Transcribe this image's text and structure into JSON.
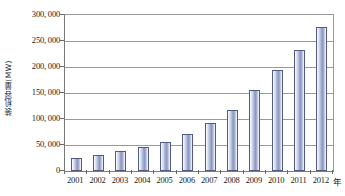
{
  "chart_data": {
    "type": "bar",
    "title": "",
    "xlabel": "年",
    "ylabel": "装机容量(MW)",
    "categories": [
      "2001",
      "2002",
      "2003",
      "2004",
      "2005",
      "2006",
      "2007",
      "2008",
      "2009",
      "2010",
      "2011",
      "2012"
    ],
    "values": [
      25000,
      31000,
      39000,
      47000,
      56000,
      71000,
      93000,
      118000,
      156000,
      194000,
      233000,
      277000
    ],
    "series": [
      {
        "name": "装机容量",
        "values": [
          25000,
          31000,
          39000,
          47000,
          56000,
          71000,
          93000,
          118000,
          156000,
          194000,
          233000,
          277000
        ]
      }
    ],
    "ylim": [
      0,
      300000
    ],
    "ytick_values": [
      300000,
      250000,
      200000,
      150000,
      100000,
      50000,
      0
    ],
    "ytick_labels": [
      "300, 000",
      "250, 000",
      "200, 000",
      "150, 000",
      "100, 000",
      "50, 000",
      "0"
    ],
    "grid": true,
    "legend": "none",
    "bar_color": "#98a3c8",
    "bar_border_color": "#515a80",
    "gridline_color": "#9a9a9a",
    "axis_color": "#7a7a7a",
    "background_color": "#ffffff",
    "text_color": "#1a1a1a"
  }
}
